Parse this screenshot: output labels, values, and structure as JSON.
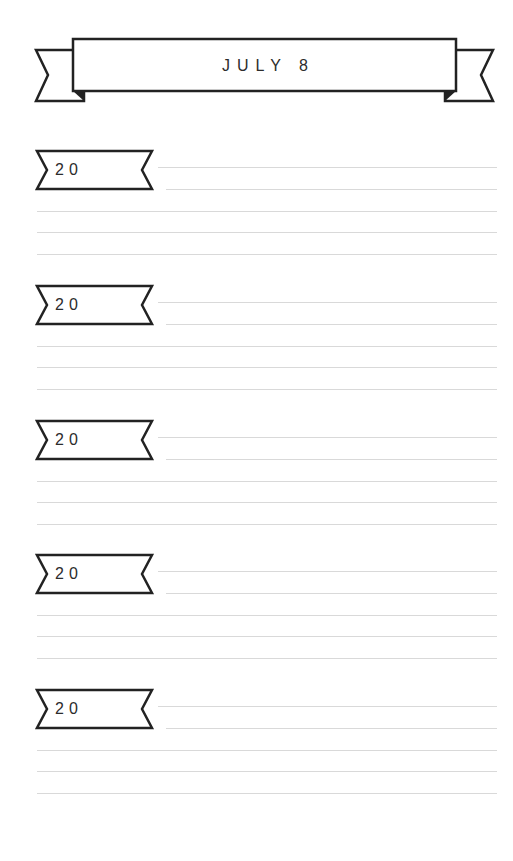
{
  "page": {
    "title": "JULY 8",
    "colors": {
      "ink": "#2a2a2a",
      "rule": "#d9d9d9",
      "background": "#ffffff"
    }
  },
  "entries": [
    {
      "year_label": "20",
      "lines": 5
    },
    {
      "year_label": "20",
      "lines": 5
    },
    {
      "year_label": "20",
      "lines": 5
    },
    {
      "year_label": "20",
      "lines": 5
    },
    {
      "year_label": "20",
      "lines": 5
    }
  ]
}
